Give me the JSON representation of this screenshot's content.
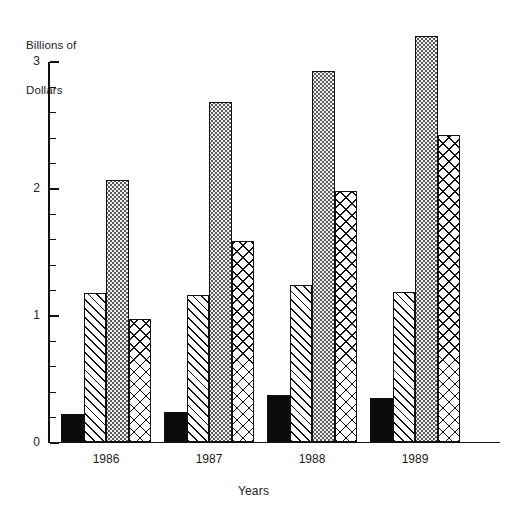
{
  "chart_data": {
    "type": "bar",
    "title": "",
    "ylabel": "Billions of\nDollars",
    "ylabel_line1": "Billions of",
    "ylabel_line2": "Dollars",
    "xlabel": "Years",
    "categories": [
      "1986",
      "1987",
      "1988",
      "1989"
    ],
    "ylim": [
      0,
      3
    ],
    "ytick_labels": [
      "0",
      "1",
      "2",
      "3"
    ],
    "ytick_values": [
      0,
      1,
      2,
      3
    ],
    "minor_tick_interval": 0.2,
    "grid": false,
    "legend": "none",
    "series": [
      {
        "name": "series-1",
        "pattern": "solid-black",
        "values": [
          0.22,
          0.24,
          0.37,
          0.35
        ]
      },
      {
        "name": "series-2",
        "pattern": "diagonal-hatch",
        "values": [
          1.17,
          1.16,
          1.24,
          1.18
        ]
      },
      {
        "name": "series-3",
        "pattern": "dotted-stipple",
        "values": [
          2.06,
          2.68,
          2.92,
          3.2
        ]
      },
      {
        "name": "series-4",
        "pattern": "cross-hatch",
        "values": [
          0.97,
          1.58,
          1.98,
          2.42
        ]
      }
    ]
  }
}
